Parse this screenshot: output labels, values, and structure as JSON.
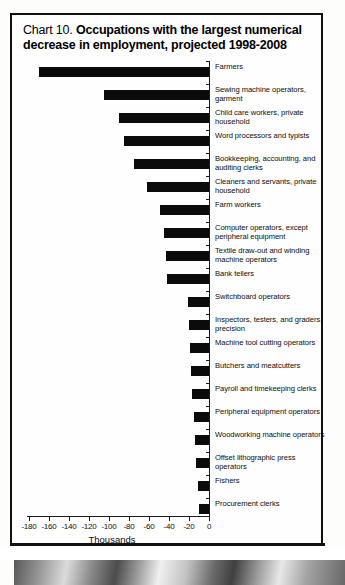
{
  "title": {
    "prefix": "Chart 10. ",
    "main": "Occupations with the largest numerical decrease in employment, projected 1998-2008"
  },
  "axis": {
    "xlabel": "Thousands",
    "xticks": [
      "-180",
      "-160",
      "-140",
      "-120",
      "-100",
      "-80",
      "-60",
      "-40",
      "-20",
      "0"
    ]
  },
  "chart_data": {
    "type": "bar",
    "orientation": "horizontal",
    "title": "Chart 10. Occupations with the largest numerical decrease in employment, projected 1998-2008",
    "xlabel": "Thousands",
    "ylabel": "",
    "xlim": [
      -180,
      0
    ],
    "xtick_values": [
      -180,
      -160,
      -140,
      -120,
      -100,
      -80,
      -60,
      -40,
      -20,
      0
    ],
    "grid": false,
    "legend": "none",
    "categories": [
      "Farmers",
      "Sewing machine operators, garment",
      "Child care workers, private household",
      "Word processors and typists",
      "Bookkeeping, accounting, and auditing clerks",
      "Cleaners and servants, private household",
      "Farm workers",
      "Computer operators, except peripheral equipment",
      "Textile draw-out and winding machine operators",
      "Bank tellers",
      "Switchboard operators",
      "Inspectors, testers, and graders, precision",
      "Machine tool cutting operators",
      "Butchers and meatcutters",
      "Payroll and timekeeping clerks",
      "Peripheral equipment operators",
      "Woodworking machine operators",
      "Offset lithographic press operators",
      "Fishers",
      "Procurement clerks"
    ],
    "values": [
      -170,
      -105,
      -90,
      -85,
      -75,
      -62,
      -49,
      -45,
      -43,
      -42,
      -21,
      -20,
      -19,
      -18,
      -17,
      -15,
      -14,
      -13,
      -11,
      -10
    ]
  }
}
